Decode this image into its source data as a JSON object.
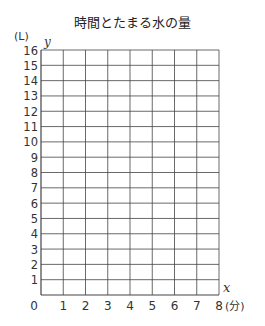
{
  "chart_data": {
    "type": "line",
    "title": "時間とたまる水の量",
    "xlabel": "x",
    "x_unit": "(分)",
    "ylabel": "y",
    "y_unit": "(L)",
    "xlim": [
      0,
      8
    ],
    "ylim": [
      0,
      16
    ],
    "x_ticks": [
      "0",
      "1",
      "2",
      "3",
      "4",
      "5",
      "6",
      "7",
      "8"
    ],
    "y_ticks": [
      "1",
      "2",
      "3",
      "4",
      "5",
      "6",
      "7",
      "8",
      "9",
      "10",
      "11",
      "12",
      "13",
      "14",
      "15",
      "16"
    ],
    "grid": true,
    "series": []
  }
}
